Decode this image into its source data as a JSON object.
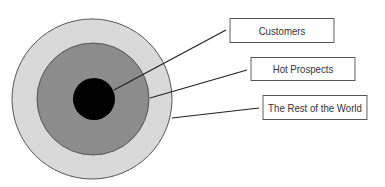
{
  "diagram": {
    "type": "concentric-target",
    "rings": [
      {
        "name": "The Rest of the World",
        "color": "#d9d9d9"
      },
      {
        "name": "Hot Prospects",
        "color": "#8c8c8c"
      },
      {
        "name": "Customers",
        "color": "#000000"
      }
    ],
    "labels": {
      "customers": "Customers",
      "hot_prospects": "Hot Prospects",
      "rest_of_world": "The Rest of the World"
    }
  }
}
